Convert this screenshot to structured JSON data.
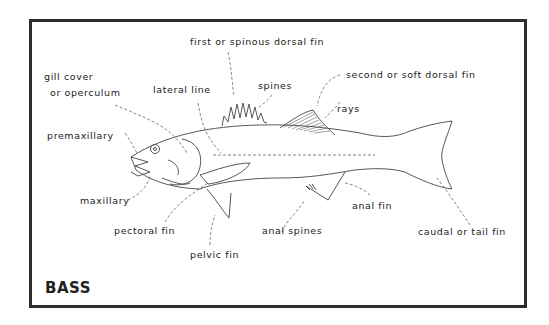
{
  "diagram": {
    "title": "BASS",
    "labels": {
      "first_dorsal": "first or spinous dorsal fin",
      "spines": "spines",
      "second_dorsal": "second or soft dorsal fin",
      "rays": "rays",
      "gill_cover_1": "gill cover",
      "gill_cover_2": "or operculum",
      "lateral_line": "lateral line",
      "premaxillary": "premaxillary",
      "maxillary": "maxillary",
      "pectoral_fin": "pectoral fin",
      "pelvic_fin": "pelvic fin",
      "anal_spines": "anal spines",
      "anal_fin": "anal fin",
      "caudal_fin": "caudal or tail fin"
    },
    "colors": {
      "border": "#2e2e2e",
      "line": "#444444",
      "text": "#222222"
    }
  }
}
